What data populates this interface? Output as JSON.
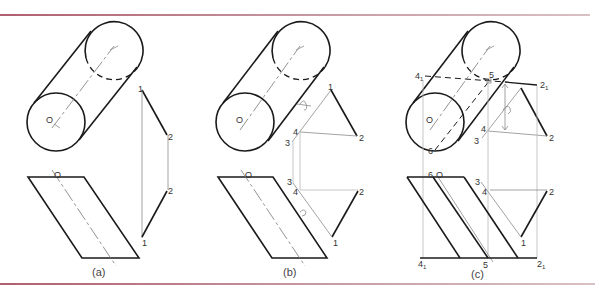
{
  "figure": {
    "panels": [
      {
        "id": "a",
        "caption": "(a)",
        "cylinder": {
          "front_center_label": "O"
        },
        "top_view_points": [
          "1",
          "2"
        ],
        "bottom_view_points": [
          "2",
          "1"
        ],
        "parallelogram_label": "O"
      },
      {
        "id": "b",
        "caption": "(b)",
        "cylinder": {
          "front_center_label": "O"
        },
        "top_view_points": [
          "1",
          "2",
          "3",
          "4"
        ],
        "bottom_view_points": [
          "3",
          "4",
          "2",
          "1"
        ],
        "parallelogram_label": "O"
      },
      {
        "id": "c",
        "caption": "(c)",
        "cylinder": {
          "front_center_label": "O",
          "tangent_label": "6"
        },
        "top_view_points": [
          "4₁",
          "5",
          "2₁",
          "4",
          "3",
          "2"
        ],
        "bottom_view_points": [
          "6",
          "O",
          "3",
          "4",
          "2",
          "1",
          "4₁",
          "5",
          "2₁"
        ]
      }
    ],
    "labels": {
      "O": "O",
      "p1": "1",
      "p2": "2",
      "p3": "3",
      "p4": "4",
      "p5": "5",
      "p6": "6",
      "p4_sub": "4",
      "p2_sub": "2",
      "sub_1": "1"
    },
    "captions": {
      "a": "(a)",
      "b": "(b)",
      "c": "(c)"
    }
  },
  "colors": {
    "rule": "#b0606e",
    "line": "#1a1a1a",
    "construction": "#8a8a8a"
  }
}
